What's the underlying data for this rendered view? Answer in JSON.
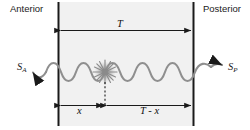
{
  "diagram": {
    "title_alt": "Anterior-Posterior wave propagation schematic",
    "type": "schematic",
    "labels": {
      "anterior": "Anterior",
      "posterior": "Posterior",
      "total_length": "T",
      "signal_anterior_base": "S",
      "signal_anterior_sub": "A",
      "signal_posterior_base": "S",
      "signal_posterior_sub": "P",
      "left_segment": "x",
      "right_segment": "T - x"
    },
    "colors": {
      "stroke": "#1a1a1a",
      "wave": "#8a8a8a",
      "burst": "#9a9a9a",
      "panel_fill": "#f1f1f1",
      "background": "#ffffff"
    },
    "geometry": {
      "left_boundary_x": 58,
      "right_boundary_x": 194,
      "top_arrow_y": 30,
      "wave_axis_y": 72,
      "bottom_arrow_y": 105,
      "source_x": 105,
      "wave_cycles": 6
    }
  }
}
